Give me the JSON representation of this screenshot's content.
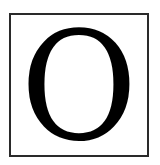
{
  "letter": "O",
  "colors": {
    "border": "#2a2a2a",
    "glyph": "#000000",
    "background": "#ffffff"
  }
}
